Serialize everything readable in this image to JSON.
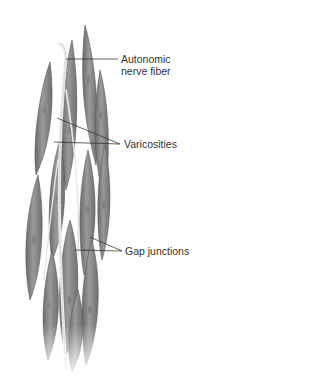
{
  "figure": {
    "labels": [
      {
        "id": "autonomic",
        "line1": "Autonomic",
        "line2": "nerve fiber"
      },
      {
        "id": "varicosities",
        "line1": "Varicosities"
      },
      {
        "id": "gap",
        "line1": "Gap junctions"
      }
    ],
    "colors": {
      "cell_dark": "#6f6f6f",
      "cell_mid": "#8e8e8e",
      "cell_light": "#b4b4b4",
      "nerve": "#e6e6e6",
      "leader": "#222222",
      "text": "#333333"
    }
  }
}
